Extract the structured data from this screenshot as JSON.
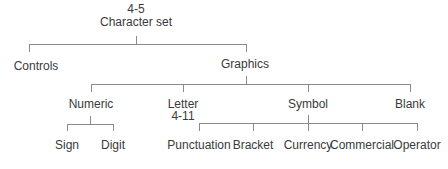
{
  "diagram": {
    "root": {
      "code": "4-5",
      "label": "Character set"
    },
    "level1": [
      {
        "label": "Controls"
      },
      {
        "label": "Graphics"
      }
    ],
    "graphics_children": [
      {
        "label": "Numeric"
      },
      {
        "label": "Letter",
        "code": "4-11"
      },
      {
        "label": "Symbol"
      },
      {
        "label": "Blank"
      }
    ],
    "numeric_children": [
      {
        "label": "Sign"
      },
      {
        "label": "Digit"
      }
    ],
    "symbol_children": [
      {
        "label": "Punctuation"
      },
      {
        "label": "Bracket"
      },
      {
        "label": "Currency"
      },
      {
        "label": "Commercial"
      },
      {
        "label": "Operator"
      }
    ]
  },
  "colors": {
    "line": "#8a8a8a",
    "text": "#3a3a3a",
    "background": "#ffffff"
  }
}
